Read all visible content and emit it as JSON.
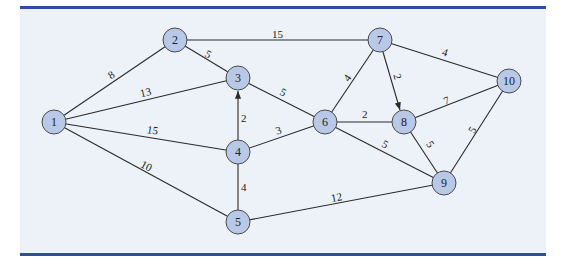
{
  "diagram": {
    "type": "weighted-network-graph",
    "colors": {
      "rule": "#2b4f9e",
      "panel": "#edf1f8",
      "node_fill": "#b8c9e8",
      "node_stroke": "#4a4a4a",
      "edge": "#2a2a2a"
    },
    "nodes": [
      {
        "id": "1",
        "label": "1"
      },
      {
        "id": "2",
        "label": "2"
      },
      {
        "id": "3",
        "label": "3"
      },
      {
        "id": "4",
        "label": "4"
      },
      {
        "id": "5",
        "label": "5"
      },
      {
        "id": "6",
        "label": "6"
      },
      {
        "id": "7",
        "label": "7"
      },
      {
        "id": "8",
        "label": "8"
      },
      {
        "id": "9",
        "label": "9"
      },
      {
        "id": "10",
        "label": "10"
      }
    ],
    "edges": [
      {
        "from": "1",
        "to": "2",
        "weight": "8",
        "directed": false
      },
      {
        "from": "1",
        "to": "3",
        "weight": "13",
        "directed": false
      },
      {
        "from": "1",
        "to": "4",
        "weight": "15",
        "directed": false
      },
      {
        "from": "1",
        "to": "5",
        "weight": "10",
        "directed": false
      },
      {
        "from": "2",
        "to": "3",
        "weight": "5",
        "directed": false
      },
      {
        "from": "2",
        "to": "7",
        "weight": "15",
        "directed": false
      },
      {
        "from": "3",
        "to": "6",
        "weight": "5",
        "directed": false
      },
      {
        "from": "4",
        "to": "3",
        "weight": "2",
        "directed": true
      },
      {
        "from": "4",
        "to": "6",
        "weight": "3",
        "directed": false
      },
      {
        "from": "4",
        "to": "5",
        "weight": "4",
        "directed": false
      },
      {
        "from": "5",
        "to": "9",
        "weight": "12",
        "directed": false
      },
      {
        "from": "6",
        "to": "7",
        "weight": "4",
        "directed": false
      },
      {
        "from": "6",
        "to": "8",
        "weight": "2",
        "directed": false
      },
      {
        "from": "6",
        "to": "9",
        "weight": "5",
        "directed": false
      },
      {
        "from": "7",
        "to": "8",
        "weight": "2",
        "directed": true
      },
      {
        "from": "7",
        "to": "10",
        "weight": "4",
        "directed": false
      },
      {
        "from": "8",
        "to": "10",
        "weight": "7",
        "directed": false
      },
      {
        "from": "8",
        "to": "9",
        "weight": "5",
        "directed": false
      },
      {
        "from": "9",
        "to": "10",
        "weight": "5",
        "directed": false
      }
    ]
  }
}
